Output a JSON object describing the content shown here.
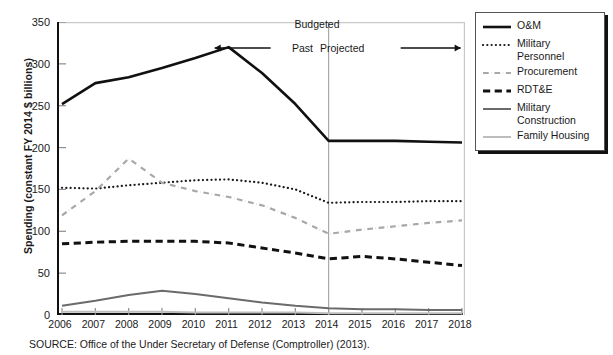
{
  "chart_data": {
    "type": "line",
    "title": "",
    "xlabel": "",
    "ylabel": "Spending (constant FY 2014 $ billions)",
    "x": [
      2006,
      2007,
      2008,
      2009,
      2010,
      2011,
      2012,
      2013,
      2014,
      2015,
      2016,
      2017,
      2018
    ],
    "xlim": [
      2006,
      2018
    ],
    "ylim": [
      0,
      350
    ],
    "yticks": [
      0,
      50,
      100,
      150,
      200,
      250,
      300,
      350
    ],
    "grid": false,
    "legend_position": "right",
    "series": [
      {
        "name": "O&M",
        "style": "solid",
        "color": "#111111",
        "width": 2.6,
        "values": [
          252,
          277,
          284,
          295,
          307,
          320,
          289,
          252,
          208,
          208,
          208,
          207,
          206
        ]
      },
      {
        "name": "Military Personnel",
        "style": "dotted",
        "color": "#1a1a1a",
        "width": 2.2,
        "values": [
          152,
          151,
          155,
          158,
          161,
          162,
          158,
          150,
          134,
          135,
          135,
          136,
          136
        ]
      },
      {
        "name": "Procurement",
        "style": "dashdot",
        "color": "#a8a8a8",
        "width": 2.2,
        "values": [
          119,
          148,
          187,
          158,
          148,
          141,
          131,
          116,
          97,
          102,
          106,
          110,
          113
        ]
      },
      {
        "name": "RDT&E",
        "style": "dashed",
        "color": "#111111",
        "width": 3.0,
        "values": [
          85,
          87,
          88,
          88,
          88,
          86,
          80,
          74,
          67,
          70,
          67,
          63,
          59
        ]
      },
      {
        "name": "Military Construction",
        "style": "solid",
        "color": "#6b6b6b",
        "width": 2.0,
        "values": [
          11,
          17,
          24,
          29,
          25,
          20,
          15,
          11,
          8,
          7,
          7,
          6,
          6
        ]
      },
      {
        "name": "Family Housing",
        "style": "solid",
        "color": "#bdbdbd",
        "width": 2.0,
        "values": [
          4,
          4,
          4,
          4,
          3,
          3,
          3,
          3,
          2,
          2,
          2,
          2,
          2
        ]
      }
    ],
    "annotations": {
      "budgeted": "Budgeted",
      "past": "Past",
      "projected": "Projected",
      "divider_x": 2014
    }
  },
  "legend": {
    "items": [
      {
        "label": "O&M"
      },
      {
        "label": "Military Personnel"
      },
      {
        "label": "Procurement"
      },
      {
        "label": "RDT&E"
      },
      {
        "label": "Military Construction"
      },
      {
        "label": "Family Housing"
      }
    ]
  },
  "source": "SOURCE: Office of the Under Secretary of Defense (Comptroller) (2013)."
}
